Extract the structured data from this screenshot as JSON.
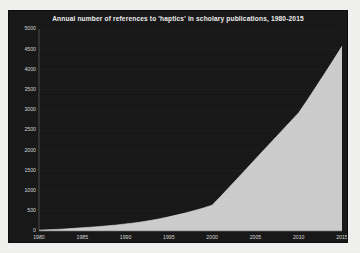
{
  "chart_data": {
    "type": "area",
    "title": "Annual number of references to 'haptics' in scholary publications, 1980-2015",
    "xlabel": "",
    "ylabel": "",
    "xlim": [
      1980,
      2015
    ],
    "ylim": [
      0,
      5000
    ],
    "grid": true,
    "legend": "none",
    "xticks": [
      "1980",
      "1985",
      "1990",
      "1995",
      "2000",
      "2005",
      "2010",
      "2015"
    ],
    "yticks": [
      "0",
      "500",
      "1000",
      "1500",
      "2000",
      "2500",
      "3000",
      "3500",
      "4000",
      "4500",
      "5000"
    ],
    "x": [
      1980,
      1981,
      1982,
      1983,
      1984,
      1985,
      1986,
      1987,
      1988,
      1989,
      1990,
      1991,
      1992,
      1993,
      1994,
      1995,
      1996,
      1997,
      1998,
      1999,
      2000,
      2001,
      2002,
      2003,
      2004,
      2005,
      2006,
      2007,
      2008,
      2009,
      2010,
      2011,
      2012,
      2013,
      2014,
      2015
    ],
    "values": [
      20,
      30,
      40,
      50,
      65,
      80,
      95,
      110,
      130,
      150,
      175,
      200,
      230,
      265,
      305,
      350,
      400,
      450,
      510,
      570,
      640,
      860,
      1090,
      1320,
      1550,
      1780,
      2010,
      2240,
      2470,
      2700,
      2930,
      3240,
      3570,
      3900,
      4230,
      4570
    ],
    "series_name": "References to 'haptics'",
    "colors": {
      "panel_background": "#171717",
      "area_fill": "#cdcdcd",
      "line": "#e2e2e2",
      "grid": "#2b2b2b",
      "tick_label": "#d7d7d7",
      "title": "#efefef",
      "page_background": "#f2f2f0"
    }
  }
}
